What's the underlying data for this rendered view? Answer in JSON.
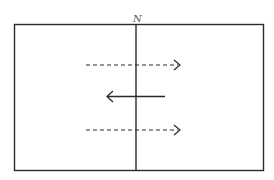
{
  "diagram": {
    "label_top": "N",
    "stroke_color": "#2a2a2a",
    "label_color": "#555555",
    "background": "#ffffff",
    "frame": {
      "x": 14,
      "y": 24,
      "width": 249,
      "height": 146
    },
    "divider": {
      "x": 136,
      "y1": 24,
      "y2": 170
    },
    "arrows": [
      {
        "id": "top-dashed",
        "style": "dashed",
        "direction": "right",
        "x1": 86,
        "x2": 180,
        "y": 65
      },
      {
        "id": "middle-solid",
        "style": "solid",
        "direction": "left",
        "x1": 165,
        "x2": 107,
        "y": 97
      },
      {
        "id": "bottom-dashed",
        "style": "dashed",
        "direction": "right",
        "x1": 86,
        "x2": 180,
        "y": 130
      }
    ]
  }
}
